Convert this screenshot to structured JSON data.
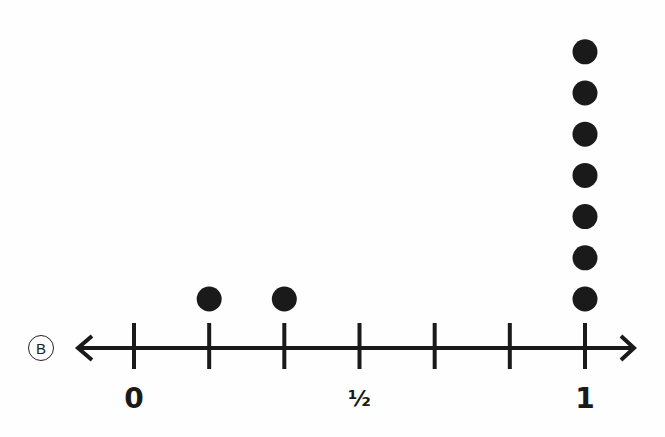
{
  "option": {
    "label": "B"
  },
  "chart_data": {
    "type": "scatter",
    "subtype": "dot-plot (line plot)",
    "title": "",
    "xlabel": "",
    "ylabel": "",
    "xlim": [
      0,
      1
    ],
    "tick_values": [
      0,
      0.1667,
      0.3333,
      0.5,
      0.6667,
      0.8333,
      1
    ],
    "tick_labels": [
      {
        "value": 0,
        "text": "0"
      },
      {
        "value": 0.5,
        "text": "½"
      },
      {
        "value": 1,
        "text": "1"
      }
    ],
    "points": [
      {
        "x": 0.1667,
        "count": 1
      },
      {
        "x": 0.3333,
        "count": 1
      },
      {
        "x": 1,
        "count": 7
      }
    ],
    "grid": false,
    "legend": null,
    "axis_arrows": "both ends"
  },
  "colors": {
    "ink": "#1a1a1a",
    "background": "#fefefe"
  }
}
